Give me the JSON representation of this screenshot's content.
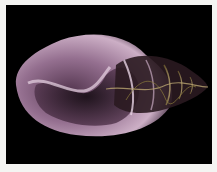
{
  "image": {
    "subject": "seashell",
    "background_color": "#000000",
    "border_color": "#f4f4f2",
    "shell_color": "#c9a3c0",
    "spire_color": "#8a7a3a"
  }
}
